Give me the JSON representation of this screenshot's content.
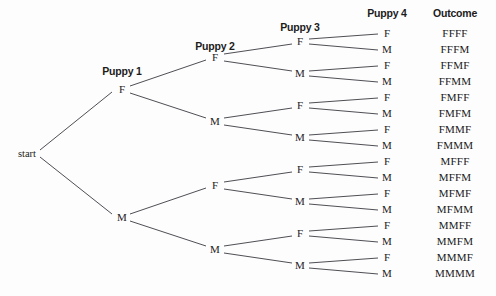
{
  "diagram": {
    "background_color": "#fdfdfd",
    "line_color": "#3a3a42",
    "text_color": "#1c1c1c",
    "root": {
      "label": "start",
      "x": 27,
      "y": 153
    },
    "headers": [
      {
        "label": "Puppy 1",
        "x": 122,
        "y": 71
      },
      {
        "label": "Puppy 2",
        "x": 215,
        "y": 46
      },
      {
        "label": "Puppy 3",
        "x": 300,
        "y": 27
      },
      {
        "label": "Puppy 4",
        "x": 387,
        "y": 13
      },
      {
        "label": "Outcome",
        "x": 455,
        "y": 13
      }
    ],
    "columns": [
      {
        "name": "puppy-1",
        "x": 122,
        "nodes": [
          {
            "label": "F",
            "y": 89
          },
          {
            "label": "M",
            "y": 217
          }
        ]
      },
      {
        "name": "puppy-2",
        "x": 215,
        "nodes": [
          {
            "label": "F",
            "y": 57
          },
          {
            "label": "M",
            "y": 121
          },
          {
            "label": "F",
            "y": 185
          },
          {
            "label": "M",
            "y": 249
          }
        ]
      },
      {
        "name": "puppy-3",
        "x": 300,
        "nodes": [
          {
            "label": "F",
            "y": 41
          },
          {
            "label": "M",
            "y": 73
          },
          {
            "label": "F",
            "y": 105
          },
          {
            "label": "M",
            "y": 137
          },
          {
            "label": "F",
            "y": 169
          },
          {
            "label": "M",
            "y": 201
          },
          {
            "label": "F",
            "y": 233
          },
          {
            "label": "M",
            "y": 265
          }
        ]
      },
      {
        "name": "puppy-4",
        "x": 387,
        "nodes": [
          {
            "label": "F",
            "y": 33
          },
          {
            "label": "M",
            "y": 49
          },
          {
            "label": "F",
            "y": 65
          },
          {
            "label": "M",
            "y": 81
          },
          {
            "label": "F",
            "y": 97
          },
          {
            "label": "M",
            "y": 113
          },
          {
            "label": "F",
            "y": 129
          },
          {
            "label": "M",
            "y": 145
          },
          {
            "label": "F",
            "y": 161
          },
          {
            "label": "M",
            "y": 177
          },
          {
            "label": "F",
            "y": 193
          },
          {
            "label": "M",
            "y": 209
          },
          {
            "label": "F",
            "y": 225
          },
          {
            "label": "M",
            "y": 241
          },
          {
            "label": "F",
            "y": 257
          },
          {
            "label": "M",
            "y": 273
          }
        ]
      }
    ],
    "outcomes": {
      "x": 455,
      "items": [
        {
          "label": "FFFF",
          "y": 33
        },
        {
          "label": "FFFM",
          "y": 49
        },
        {
          "label": "FFMF",
          "y": 65
        },
        {
          "label": "FFMM",
          "y": 81
        },
        {
          "label": "FMFF",
          "y": 97
        },
        {
          "label": "FMFM",
          "y": 113
        },
        {
          "label": "FMMF",
          "y": 129
        },
        {
          "label": "FMMM",
          "y": 145
        },
        {
          "label": "MFFF",
          "y": 161
        },
        {
          "label": "MFFM",
          "y": 177
        },
        {
          "label": "MFMF",
          "y": 193
        },
        {
          "label": "MFMM",
          "y": 209
        },
        {
          "label": "MMFF",
          "y": 225
        },
        {
          "label": "MMFM",
          "y": 241
        },
        {
          "label": "MMMF",
          "y": 257
        },
        {
          "label": "MMMM",
          "y": 273
        }
      ]
    },
    "edges": [
      {
        "x1": 40,
        "y1": 150,
        "x2": 112,
        "y2": 92
      },
      {
        "x1": 40,
        "y1": 157,
        "x2": 112,
        "y2": 214
      },
      {
        "x1": 130,
        "y1": 86,
        "x2": 206,
        "y2": 60
      },
      {
        "x1": 130,
        "y1": 93,
        "x2": 206,
        "y2": 118
      },
      {
        "x1": 130,
        "y1": 214,
        "x2": 206,
        "y2": 188
      },
      {
        "x1": 130,
        "y1": 221,
        "x2": 206,
        "y2": 246
      },
      {
        "x1": 224,
        "y1": 54,
        "x2": 292,
        "y2": 44
      },
      {
        "x1": 224,
        "y1": 61,
        "x2": 292,
        "y2": 71
      },
      {
        "x1": 224,
        "y1": 118,
        "x2": 292,
        "y2": 108
      },
      {
        "x1": 224,
        "y1": 125,
        "x2": 292,
        "y2": 135
      },
      {
        "x1": 224,
        "y1": 182,
        "x2": 292,
        "y2": 172
      },
      {
        "x1": 224,
        "y1": 189,
        "x2": 292,
        "y2": 199
      },
      {
        "x1": 224,
        "y1": 246,
        "x2": 292,
        "y2": 236
      },
      {
        "x1": 224,
        "y1": 253,
        "x2": 292,
        "y2": 263
      },
      {
        "x1": 309,
        "y1": 39,
        "x2": 378,
        "y2": 34
      },
      {
        "x1": 309,
        "y1": 44,
        "x2": 378,
        "y2": 50
      },
      {
        "x1": 309,
        "y1": 71,
        "x2": 378,
        "y2": 66
      },
      {
        "x1": 309,
        "y1": 76,
        "x2": 378,
        "y2": 82
      },
      {
        "x1": 309,
        "y1": 103,
        "x2": 378,
        "y2": 98
      },
      {
        "x1": 309,
        "y1": 108,
        "x2": 378,
        "y2": 114
      },
      {
        "x1": 309,
        "y1": 135,
        "x2": 378,
        "y2": 130
      },
      {
        "x1": 309,
        "y1": 140,
        "x2": 378,
        "y2": 146
      },
      {
        "x1": 309,
        "y1": 167,
        "x2": 378,
        "y2": 162
      },
      {
        "x1": 309,
        "y1": 172,
        "x2": 378,
        "y2": 178
      },
      {
        "x1": 309,
        "y1": 199,
        "x2": 378,
        "y2": 194
      },
      {
        "x1": 309,
        "y1": 204,
        "x2": 378,
        "y2": 210
      },
      {
        "x1": 309,
        "y1": 231,
        "x2": 378,
        "y2": 226
      },
      {
        "x1": 309,
        "y1": 236,
        "x2": 378,
        "y2": 242
      },
      {
        "x1": 309,
        "y1": 263,
        "x2": 378,
        "y2": 258
      },
      {
        "x1": 309,
        "y1": 268,
        "x2": 378,
        "y2": 274
      }
    ]
  }
}
